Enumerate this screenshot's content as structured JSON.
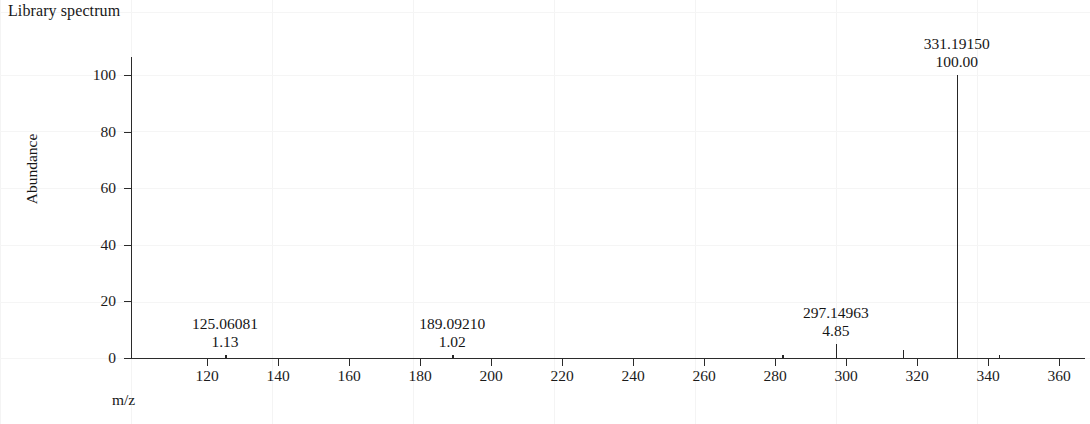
{
  "figure": {
    "title": "Library spectrum",
    "x_axis_title": "m/z",
    "y_axis_title": "Abundance"
  },
  "chart_data": {
    "type": "bar",
    "title": "Library spectrum",
    "xlabel": "m/z",
    "ylabel": "Abundance",
    "xlim": [
      104,
      372
    ],
    "ylim": [
      0,
      107
    ],
    "grid": "faint",
    "legend": "none",
    "xticks": [
      120,
      140,
      160,
      180,
      200,
      220,
      240,
      260,
      280,
      300,
      320,
      340,
      360
    ],
    "yticks": [
      0,
      20,
      40,
      60,
      80,
      100
    ],
    "x": [
      125.06081,
      189.0921,
      282.0,
      297.14963,
      316.0,
      331.1915,
      343.0
    ],
    "values": [
      1.13,
      1.02,
      1.1,
      4.85,
      3.0,
      100.0,
      1.0
    ],
    "labeled_peaks": [
      {
        "mz": "125.06081",
        "abundance": "1.13",
        "mz_value": 125.06081,
        "value": 1.13
      },
      {
        "mz": "189.09210",
        "abundance": "1.02",
        "mz_value": 189.0921,
        "value": 1.02
      },
      {
        "mz": "297.14963",
        "abundance": "4.85",
        "mz_value": 297.14963,
        "value": 4.85
      },
      {
        "mz": "331.19150",
        "abundance": "100.00",
        "mz_value": 331.1915,
        "value": 100.0
      }
    ],
    "unlabeled_peaks": [
      {
        "mz_value": 282.0,
        "value": 1.1
      },
      {
        "mz_value": 316.0,
        "value": 3.0
      },
      {
        "mz_value": 343.0,
        "value": 1.0
      }
    ],
    "base_peak": {
      "mz": "331.19150",
      "abundance": "100.00"
    },
    "colors": {
      "trace": "#262626",
      "axis": "#2b2b2b",
      "text": "#1b1b1b",
      "grid": "#f4f4f4"
    }
  },
  "axes": {
    "y_tick_labels": [
      "100",
      "80",
      "60",
      "40",
      "20",
      "0"
    ],
    "x_tick_labels": [
      "120",
      "140",
      "160",
      "180",
      "200",
      "220",
      "240",
      "260",
      "280",
      "300",
      "320",
      "340",
      "360"
    ]
  }
}
